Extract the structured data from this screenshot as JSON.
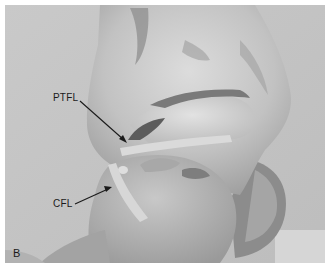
{
  "figure": {
    "panel_letter": "B",
    "labels": [
      {
        "id": "ptfl",
        "text": "PTFL",
        "x": 53,
        "y": 93,
        "arrow_from": [
          80,
          101
        ],
        "arrow_to": [
          127,
          142
        ]
      },
      {
        "id": "cfl",
        "text": "CFL",
        "x": 53,
        "y": 199,
        "arrow_from": [
          75,
          204
        ],
        "arrow_to": [
          111,
          187
        ]
      }
    ],
    "colors": {
      "background": "#c4c4c4",
      "bone_light": "#d9d9d9",
      "bone_mid": "#b3b3b3",
      "shadow": "#6e6e6e",
      "text": "#1a1a1a"
    }
  }
}
